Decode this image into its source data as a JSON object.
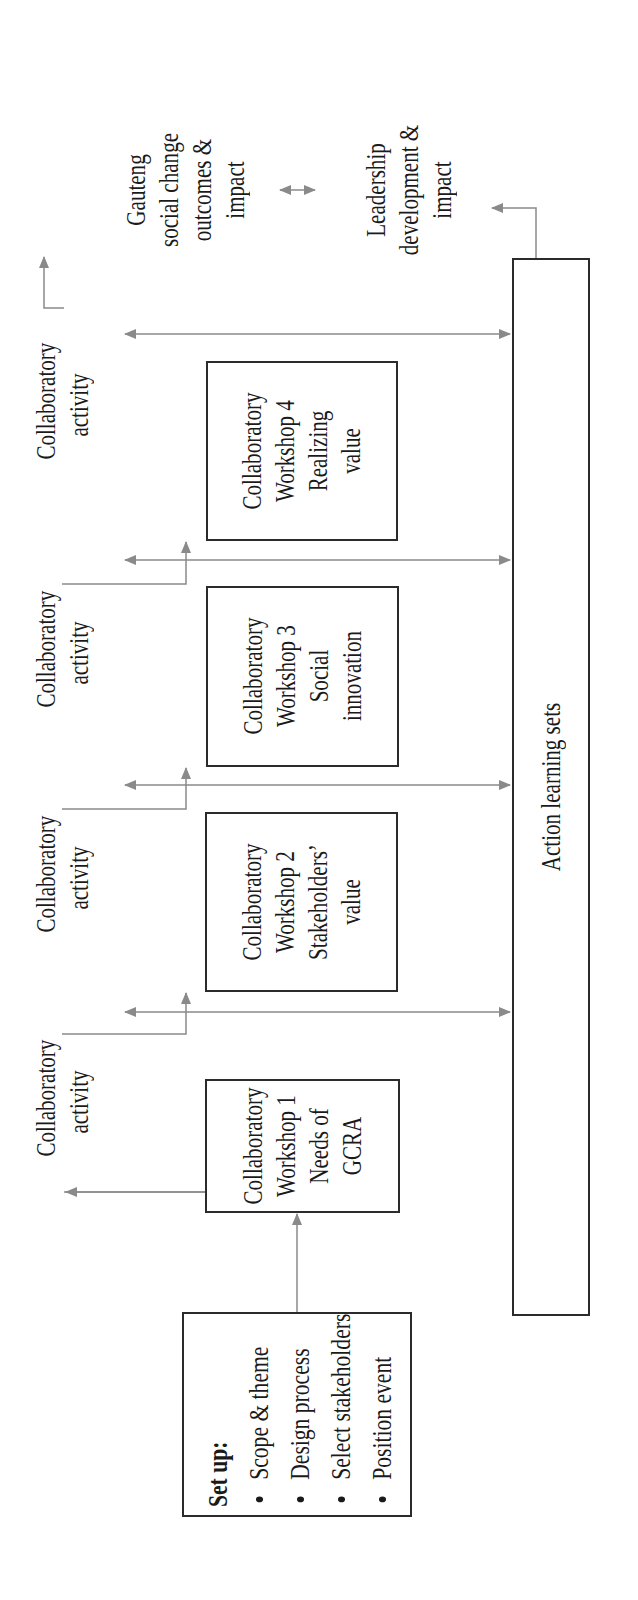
{
  "diagram": {
    "orientation": "rotated -90deg (text reads bottom-to-top)",
    "setup": {
      "title": "Set up:",
      "items": [
        "Scope & theme",
        "Design process",
        "Select stakeholders",
        "Position event"
      ]
    },
    "workshops": [
      {
        "line1": "Collaboratory",
        "line2": "Workshop 1",
        "line3": "Needs of",
        "line4": "GCRA"
      },
      {
        "line1": "Collaboratory",
        "line2": "Workshop 2",
        "line3": "Stakeholders’",
        "line4": "value"
      },
      {
        "line1": "Collaboratory",
        "line2": "Workshop 3",
        "line3": "Social",
        "line4": "innovation"
      },
      {
        "line1": "Collaboratory",
        "line2": "Workshop 4",
        "line3": "Realizing",
        "line4": "value"
      }
    ],
    "activities": [
      {
        "line1": "Collaboratory",
        "line2": "activity"
      },
      {
        "line1": "Collaboratory",
        "line2": "activity"
      },
      {
        "line1": "Collaboratory",
        "line2": "activity"
      },
      {
        "line1": "Collaboratory",
        "line2": "activity"
      }
    ],
    "action_learning": {
      "label": "Action learning sets"
    },
    "outcomes": {
      "gauteng": {
        "line1": "Gauteng",
        "line2": "social change",
        "line3": "outcomes &",
        "line4": "impact"
      },
      "leadership": {
        "line1": "Leadership",
        "line2": "development &",
        "line3": "impact"
      }
    },
    "colors": {
      "box_border": "#2b2b2b",
      "arrow": "#8a8a8a",
      "text": "#1a1a1a",
      "background": "#ffffff"
    }
  }
}
